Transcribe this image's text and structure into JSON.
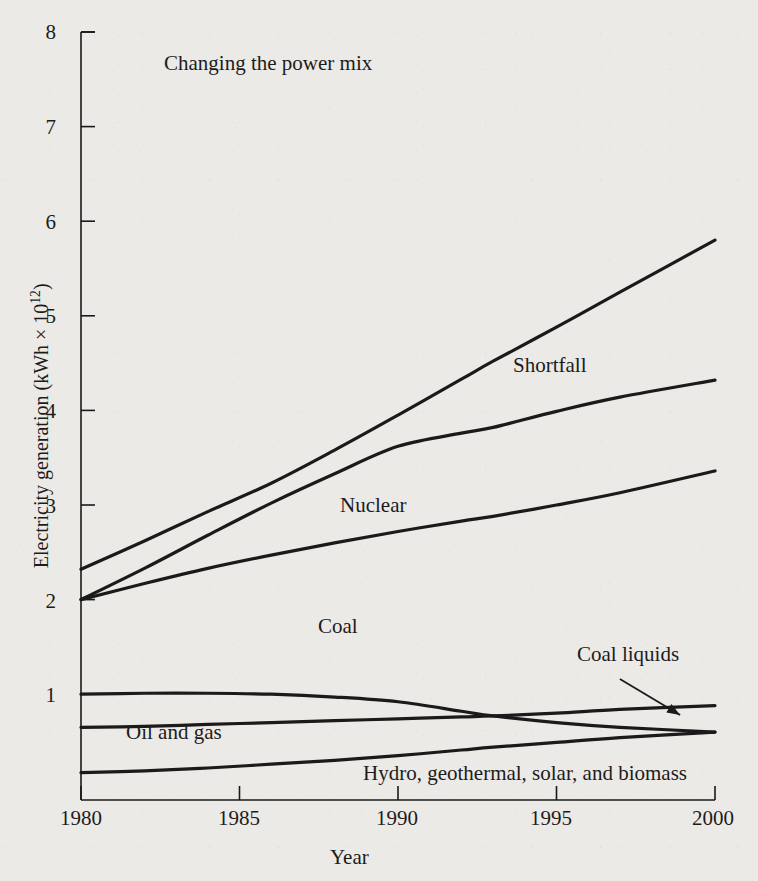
{
  "figure": {
    "title": "Changing the power mix",
    "background_color": "#eceae6",
    "ink_color": "#1a1a1a"
  },
  "axes": {
    "x_title": "Year",
    "y_title_prefix": "Electricity generation (kWh × 10",
    "y_title_exponent": "12",
    "y_title_suffix": ")",
    "x_ticks": [
      "1980",
      "1985",
      "1990",
      "1995",
      "2000"
    ],
    "y_ticks": [
      "8",
      "7",
      "6",
      "5",
      "4",
      "3",
      "2",
      "1"
    ]
  },
  "series_labels": {
    "shortfall": "Shortfall",
    "nuclear": "Nuclear",
    "coal": "Coal",
    "coal_liquids": "Coal liquids",
    "oil_and_gas": "Oil and gas",
    "hydro": "Hydro, geothermal, solar, and biomass"
  },
  "chart_data": {
    "type": "line",
    "title": "Changing the power mix",
    "xlabel": "Year",
    "ylabel": "Electricity generation (kWh × 10^12)",
    "xlim": [
      1980,
      2000
    ],
    "ylim": [
      0,
      8
    ],
    "grid": false,
    "legend": "inline-annotations",
    "x_ticks": [
      1980,
      1985,
      1990,
      1995,
      2000
    ],
    "y_ticks": [
      1,
      2,
      3,
      4,
      5,
      6,
      7,
      8
    ],
    "x": [
      1980,
      1982,
      1984,
      1986,
      1988,
      1990,
      1992,
      1993,
      1995,
      1997,
      2000
    ],
    "series": [
      {
        "name": "Shortfall",
        "label_position": {
          "x": 1996.3,
          "y": 4.62
        },
        "values": [
          2.32,
          2.62,
          2.93,
          3.23,
          3.58,
          3.95,
          4.33,
          4.52,
          4.88,
          5.25,
          5.8
        ]
      },
      {
        "name": "Nuclear",
        "label_position": {
          "x": 1988.2,
          "y": 3.15
        },
        "values": [
          2.0,
          2.33,
          2.68,
          3.02,
          3.33,
          3.62,
          3.76,
          3.82,
          3.99,
          4.14,
          4.32
        ]
      },
      {
        "name": "Coal",
        "label_position": {
          "x": 1987.5,
          "y": 1.87
        },
        "values": [
          2.0,
          2.17,
          2.33,
          2.47,
          2.6,
          2.72,
          2.83,
          2.88,
          3.0,
          3.13,
          3.36
        ]
      },
      {
        "name": "Oil and gas",
        "label_position": {
          "x": 1981.6,
          "y": 0.75
        },
        "values": [
          1.0,
          1.01,
          1.01,
          1.0,
          0.97,
          0.92,
          0.82,
          0.77,
          0.7,
          0.65,
          0.6
        ]
      },
      {
        "name": "Coal liquids",
        "label_position": {
          "x": 1996.9,
          "y": 1.28
        },
        "annotation_arrow": {
          "from": {
            "x": 1997.0,
            "y": 1.16
          },
          "to": {
            "x": 1998.9,
            "y": 0.78
          }
        },
        "values": [
          0.65,
          0.66,
          0.68,
          0.7,
          0.72,
          0.74,
          0.76,
          0.77,
          0.8,
          0.84,
          0.88
        ]
      },
      {
        "name": "Hydro, geothermal, solar, and biomass",
        "label_position": {
          "x": 1989.0,
          "y": 0.32
        },
        "values": [
          0.17,
          0.19,
          0.22,
          0.26,
          0.3,
          0.35,
          0.41,
          0.44,
          0.49,
          0.54,
          0.6
        ]
      }
    ]
  }
}
